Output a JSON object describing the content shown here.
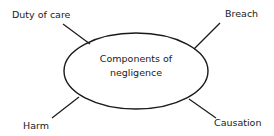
{
  "diagram": {
    "center": {
      "line1": "Components of",
      "line2": "negligence"
    },
    "nodes": [
      {
        "label": "Duty of care",
        "position": "top-left"
      },
      {
        "label": "Breach",
        "position": "top-right"
      },
      {
        "label": "Harm",
        "position": "bottom-left"
      },
      {
        "label": "Causation",
        "position": "bottom-right"
      }
    ],
    "colors": {
      "stroke": "#1a1a1a",
      "background": "#ffffff"
    }
  }
}
